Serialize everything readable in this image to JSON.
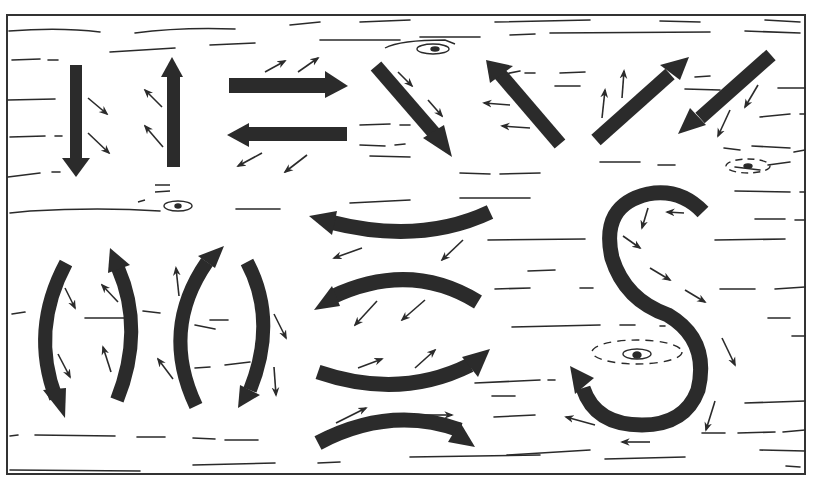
{
  "figure": {
    "colors": {
      "ink": "#2b2b2b",
      "background": "#ffffff"
    },
    "frame": {
      "x": 7,
      "y": 15,
      "width": 798,
      "height": 459
    },
    "groups": [
      {
        "name": "straight-vertical-arrows",
        "arrows": [
          "down",
          "up"
        ]
      },
      {
        "name": "straight-horizontal-arrows",
        "arrows": [
          "right",
          "left"
        ]
      },
      {
        "name": "diagonal-arrows",
        "arrows": [
          "down-right",
          "up-left",
          "up-right",
          "down-left"
        ]
      },
      {
        "name": "curved-vertical-arrows",
        "arrows": [
          "down-curve-left",
          "up-curve-right",
          "up-curve-left",
          "down-curve-right"
        ]
      },
      {
        "name": "curved-horizontal-arrows",
        "arrows": [
          "left-arc-up",
          "left-arc-down",
          "right-arc-up",
          "right-arc-down"
        ]
      },
      {
        "name": "s-curve-arrow",
        "arrows": [
          "s-shape"
        ]
      }
    ],
    "knots": 4
  }
}
